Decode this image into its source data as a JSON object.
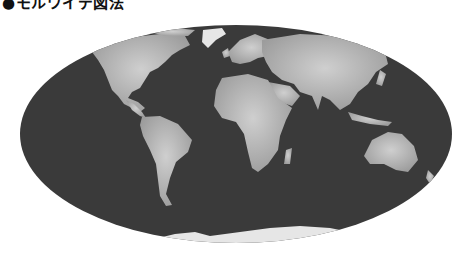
{
  "title": "●モルワイデ図法",
  "map": {
    "projection": "Mollweide",
    "style": "grayscale",
    "colors": {
      "ocean": "#3a3a3a",
      "land": "#a9a9a9",
      "land_light": "#c8c8c8",
      "ice": "#e6e6e6",
      "background": "#ffffff"
    },
    "regions": [
      "North America",
      "South America",
      "Greenland",
      "Europe",
      "Africa",
      "Asia",
      "Australia",
      "Antarctica",
      "Madagascar",
      "Japan",
      "Indonesia"
    ]
  }
}
